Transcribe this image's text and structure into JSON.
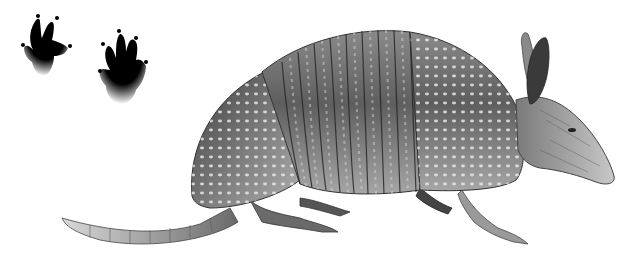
{
  "image": {
    "subject": "armadillo",
    "style": "grayscale pencil illustration",
    "background": "#ffffff",
    "elements": [
      {
        "name": "front-footprint",
        "icon": "footprint-icon"
      },
      {
        "name": "hind-footprint",
        "icon": "footprint-icon"
      },
      {
        "name": "armadillo",
        "icon": "armadillo-illustration"
      }
    ]
  },
  "colors": {
    "ink": "#0a0a0a",
    "shell_dark": "#3a3a3a",
    "shell_mid": "#7a7a7a",
    "shell_light": "#c8c8c8"
  }
}
